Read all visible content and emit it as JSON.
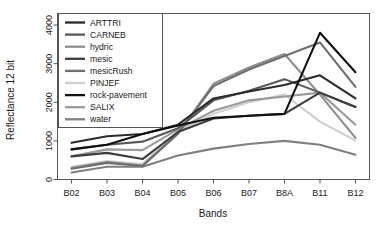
{
  "chart_data": {
    "type": "line",
    "title": "",
    "xlabel": "Bands",
    "ylabel": "Reflectance 12 bit",
    "categories": [
      "B02",
      "B03",
      "B04",
      "B05",
      "B06",
      "B07",
      "B8A",
      "B11",
      "B12"
    ],
    "ylim": [
      0,
      4300
    ],
    "yticks": [
      0,
      1000,
      2000,
      3000,
      4000
    ],
    "ytick_labels": [
      "0",
      "1000",
      "2000",
      "3000",
      "4000"
    ],
    "grid": false,
    "legend_position": "top-left",
    "series": [
      {
        "name": "ARTTRI",
        "color": "#2b2b2b",
        "values": [
          950,
          1120,
          1180,
          1420,
          2100,
          2280,
          2450,
          2700,
          2100
        ]
      },
      {
        "name": "CARNEB",
        "color": "#5a5a5a",
        "values": [
          780,
          900,
          980,
          1330,
          2050,
          2300,
          2600,
          2250,
          1880
        ]
      },
      {
        "name": "hydric",
        "color": "#8e8e8e",
        "values": [
          300,
          450,
          360,
          1180,
          2480,
          2900,
          3250,
          2200,
          1080
        ]
      },
      {
        "name": "mesic",
        "color": "#3d3d3d",
        "values": [
          600,
          690,
          530,
          1230,
          1580,
          1650,
          1700,
          2250,
          1880
        ]
      },
      {
        "name": "mesicRush",
        "color": "#6e6e6e",
        "values": [
          280,
          430,
          350,
          1200,
          2420,
          2850,
          3200,
          3550,
          2400
        ]
      },
      {
        "name": "PINJEF",
        "color": "#d0d0d0",
        "values": [
          330,
          480,
          400,
          1250,
          1700,
          2000,
          2200,
          1500,
          1010
        ]
      },
      {
        "name": "rock-pavement",
        "color": "#111111",
        "values": [
          780,
          900,
          1180,
          1400,
          1600,
          1650,
          1700,
          3800,
          2780
        ]
      },
      {
        "name": "SALIX",
        "color": "#9a9a9a",
        "values": [
          600,
          780,
          760,
          1300,
          1780,
          2050,
          2150,
          2250,
          1420
        ]
      },
      {
        "name": "water",
        "color": "#7f7f7f",
        "values": [
          180,
          330,
          330,
          620,
          800,
          920,
          1000,
          900,
          640
        ]
      }
    ]
  },
  "axes": {
    "x_title": "Bands",
    "y_title": "Reflectance 12 bit"
  }
}
